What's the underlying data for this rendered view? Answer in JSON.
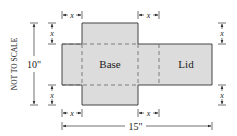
{
  "diagram": {
    "side_note": "NOT TO SCALE",
    "height_label": "10\"",
    "width_label": "15\"",
    "cut_label": "x",
    "panels": {
      "base": "Base",
      "lid": "Lid"
    },
    "colors": {
      "fill": "#dcdcdc",
      "stroke": "#444444",
      "dash": "#666666"
    }
  }
}
